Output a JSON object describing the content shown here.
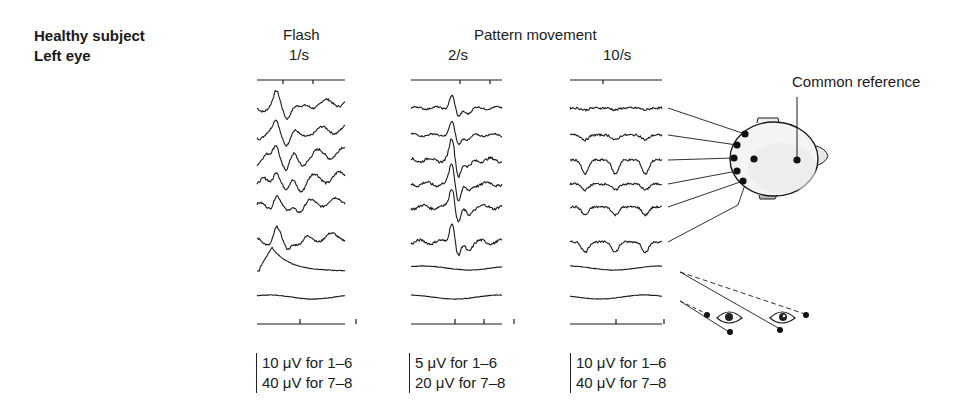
{
  "subject": {
    "line1": "Healthy subject",
    "line2": "Left eye"
  },
  "headers": {
    "flash": "Flash",
    "pattern": "Pattern movement"
  },
  "columns": [
    {
      "rate": "1/s",
      "scale": [
        "10 μV for 1–6",
        "40 μV for 7–8"
      ],
      "type": "flash"
    },
    {
      "rate": "2/s",
      "scale": [
        "5 μV for 1–6",
        "20 μV for 7–8"
      ],
      "type": "pattern"
    },
    {
      "rate": "10/s",
      "scale": [
        "10 μV for 1–6",
        "40 μV for 7–8"
      ],
      "type": "pattern"
    }
  ],
  "labels": {
    "common_reference": "Common reference"
  },
  "channels": {
    "eeg": [
      1,
      2,
      3,
      4,
      5,
      6
    ],
    "eog": [
      7,
      8
    ]
  },
  "colors": {
    "ink": "#1a1a1a",
    "head_fill": "#f4f4f4"
  }
}
